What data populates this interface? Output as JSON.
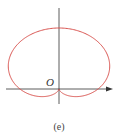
{
  "figure": {
    "origin_label": "O",
    "caption": "(e)",
    "colors": {
      "curve": "#d9534f",
      "axis": "#333333"
    }
  },
  "chart_data": {
    "type": "line",
    "title": "",
    "equation": "r = 1 + sin(θ)",
    "axes": {
      "x_arrow": true,
      "y_arrow": false,
      "origin_label": "O"
    },
    "xlabel": "",
    "ylabel": "",
    "grid": false,
    "caption": "(e)"
  }
}
